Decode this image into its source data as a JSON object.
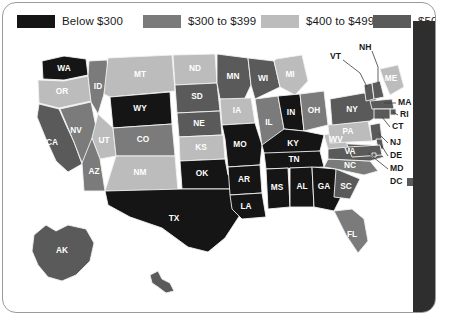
{
  "card": {
    "background": "#ffffff",
    "border_color": "#9a9a9a",
    "edge_bar_color": "#2e2e2e"
  },
  "legend": {
    "title": "",
    "items": [
      {
        "label": "Below $300",
        "color": "#151515"
      },
      {
        "label": "$300 to $399",
        "color": "#7b7b7b"
      },
      {
        "label": "$400 to $499",
        "color": "#bcbcbc"
      },
      {
        "label": "$500 and above",
        "color": "#5a5a5a"
      }
    ]
  },
  "chart_data": {
    "type": "heatmap",
    "title": "",
    "subtitle": "",
    "xlabel": "",
    "ylabel": "",
    "map_region": "United States",
    "classification": "choropleth",
    "class_breaks": [
      "Below $300",
      "$300 to $399",
      "$400 to $499",
      "$500 and above"
    ],
    "class_colors": [
      "#151515",
      "#7b7b7b",
      "#bcbcbc",
      "#5a5a5a"
    ],
    "categories": [
      "WA",
      "OR",
      "CA",
      "NV",
      "ID",
      "MT",
      "WY",
      "UT",
      "CO",
      "AZ",
      "NM",
      "ND",
      "SD",
      "NE",
      "KS",
      "OK",
      "TX",
      "MN",
      "IA",
      "MO",
      "AR",
      "LA",
      "WI",
      "IL",
      "MI",
      "IN",
      "OH",
      "KY",
      "TN",
      "MS",
      "AL",
      "GA",
      "FL",
      "SC",
      "NC",
      "VA",
      "WV",
      "PA",
      "NY",
      "VT",
      "NH",
      "ME",
      "MA",
      "RI",
      "CT",
      "NJ",
      "DE",
      "MD",
      "DC",
      "AK",
      "HI"
    ],
    "values": [
      "Below $300",
      "$400 to $499",
      "$500 and above",
      "$300 to $399",
      "$300 to $399",
      "$400 to $499",
      "Below $300",
      "$400 to $499",
      "$300 to $399",
      "$300 to $399",
      "$400 to $499",
      "$400 to $499",
      "$500 and above",
      "$500 and above",
      "$400 to $499",
      "Below $300",
      "Below $300",
      "$500 and above",
      "$400 to $499",
      "Below $300",
      "Below $300",
      "Below $300",
      "$500 and above",
      "$300 to $399",
      "$400 to $499",
      "Below $300",
      "$300 to $399",
      "Below $300",
      "Below $300",
      "Below $300",
      "Below $300",
      "Below $300",
      "$300 to $399",
      "$500 and above",
      "$300 to $399",
      "$500 and above",
      "$400 to $499",
      "$400 to $499",
      "$500 and above",
      "$500 and above",
      "$500 and above",
      "$400 to $499",
      "$500 and above",
      "$500 and above",
      "$500 and above",
      "$500 and above",
      "$500 and above",
      "$500 and above",
      "$500 and above",
      "$500 and above",
      "$500 and above"
    ],
    "legend_position": "top",
    "grid": false
  },
  "map_labels": {
    "inline": [
      "WA",
      "OR",
      "CA",
      "NV",
      "ID",
      "MT",
      "WY",
      "UT",
      "CO",
      "AZ",
      "NM",
      "ND",
      "SD",
      "NE",
      "KS",
      "OK",
      "TX",
      "MN",
      "IA",
      "MO",
      "AR",
      "LA",
      "WI",
      "IL",
      "MI",
      "IN",
      "OH",
      "KY",
      "TN",
      "MS",
      "AL",
      "GA",
      "FL",
      "SC",
      "NC",
      "VA",
      "WV",
      "PA",
      "NY",
      "ME",
      "AK",
      "HI"
    ],
    "callouts": [
      "NH",
      "VT",
      "MA",
      "RI",
      "CT",
      "NJ",
      "DE",
      "MD",
      "DC"
    ]
  }
}
